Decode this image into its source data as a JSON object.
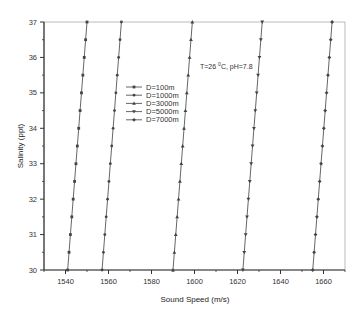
{
  "chart_data": {
    "type": "line",
    "title": "",
    "annotation": "T=26 °C, pH=7.8",
    "annotation_parts": {
      "prefix": "T=26 ",
      "sup": "0",
      "suffix": "C, pH=7.8"
    },
    "xlabel": "Sound Speed (m/s)",
    "ylabel": "Salinity (ppt)",
    "xlim": [
      1530,
      1670
    ],
    "ylim": [
      30,
      37
    ],
    "x_ticks": [
      1540,
      1560,
      1580,
      1600,
      1620,
      1640,
      1660
    ],
    "y_ticks": [
      30,
      31,
      32,
      33,
      34,
      35,
      36,
      37
    ],
    "grid": false,
    "legend_position": "upper-left-center",
    "y": [
      30,
      30.5,
      31,
      31.5,
      32,
      32.5,
      33,
      33.5,
      34,
      34.5,
      35,
      35.5,
      36,
      36.5,
      37
    ],
    "series": [
      {
        "name": "D=100m",
        "marker": "square",
        "x_start": 1541.0,
        "x_end": 1550.0
      },
      {
        "name": "D=1000m",
        "marker": "circle",
        "x_start": 1557.0,
        "x_end": 1566.0
      },
      {
        "name": "D=3000m",
        "marker": "triangle-up",
        "x_start": 1590.0,
        "x_end": 1599.0
      },
      {
        "name": "D=5000m",
        "marker": "triangle-down",
        "x_start": 1622.5,
        "x_end": 1631.5
      },
      {
        "name": "D=7000m",
        "marker": "diamond",
        "x_start": 1655.0,
        "x_end": 1664.0
      }
    ]
  }
}
